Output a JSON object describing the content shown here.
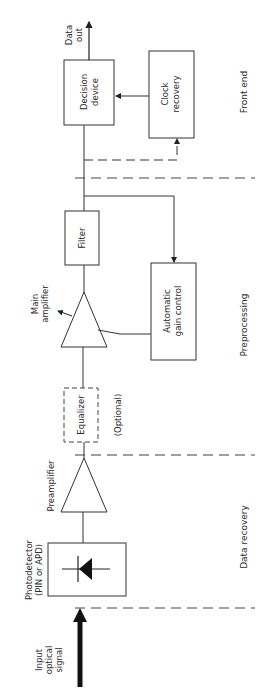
{
  "diagram": {
    "type": "block-diagram",
    "orientation": "rotated-90-ccw",
    "blocks": {
      "photodetector": {
        "label_line1": "Photodetector",
        "label_line2": "(PIN or APD)"
      },
      "preamplifier": {
        "label": "Preamplifier"
      },
      "equalizer": {
        "label": "Equalizer",
        "note": "(Optional)"
      },
      "main_amplifier": {
        "label_line1": "Main",
        "label_line2": "amplifier"
      },
      "filter": {
        "label": "Filter"
      },
      "agc": {
        "label_line1": "Automatic",
        "label_line2": "gain control"
      },
      "decision_device": {
        "label_line1": "Decision",
        "label_line2": "device"
      },
      "clock_recovery": {
        "label_line1": "Clock",
        "label_line2": "recovery"
      }
    },
    "input": {
      "label_line1": "Input",
      "label_line2": "optical",
      "label_line3": "signal"
    },
    "output": {
      "label_line1": "Data",
      "label_line2": "out"
    },
    "sections": [
      {
        "name": "Front end"
      },
      {
        "name": "Preprocessing"
      },
      {
        "name": "Data recovery"
      }
    ],
    "colors": {
      "line": "#333333",
      "fill": "#111111",
      "background": "#ffffff"
    }
  }
}
